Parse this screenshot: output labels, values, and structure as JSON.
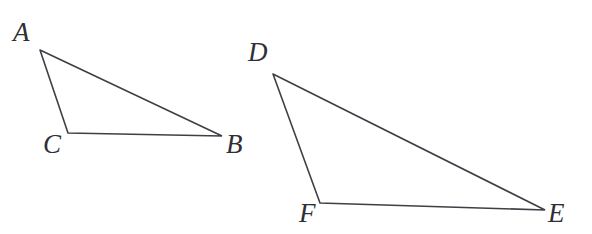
{
  "figure": {
    "kind": "geometry-diagram",
    "width": 592,
    "height": 234,
    "background_color": "#ffffff",
    "stroke_color": "#3f3f47",
    "stroke_width": 1.6,
    "label_color": "#2f2f36",
    "label_font_size": 27,
    "label_style": "italic-serif"
  },
  "chart_data": {
    "type": "diagram",
    "title": "",
    "shapes": [
      {
        "name": "triangle-abc",
        "label": "ABC",
        "vertices": [
          {
            "id": "A",
            "x": 40,
            "y": 50
          },
          {
            "id": "B",
            "x": 222,
            "y": 136
          },
          {
            "id": "C",
            "x": 68,
            "y": 133
          }
        ],
        "edges": [
          "A-B",
          "B-C",
          "C-A"
        ]
      },
      {
        "name": "triangle-def",
        "label": "DEF",
        "vertices": [
          {
            "id": "D",
            "x": 273,
            "y": 74
          },
          {
            "id": "E",
            "x": 545,
            "y": 210
          },
          {
            "id": "F",
            "x": 320,
            "y": 203
          }
        ],
        "edges": [
          "D-E",
          "E-F",
          "F-D"
        ]
      }
    ]
  },
  "labels": {
    "a": {
      "text": "A",
      "x": 13,
      "y": 19
    },
    "b": {
      "text": "B",
      "x": 226,
      "y": 131
    },
    "c": {
      "text": "C",
      "x": 43,
      "y": 131
    },
    "d": {
      "text": "D",
      "x": 248,
      "y": 39
    },
    "e": {
      "text": "E",
      "x": 548,
      "y": 200
    },
    "f": {
      "text": "F",
      "x": 299,
      "y": 200
    }
  },
  "polyline_points": {
    "triangle_abc": "40,50 222,136 68,133 40,50",
    "triangle_def": "273,74 545,210 320,203 273,74"
  }
}
